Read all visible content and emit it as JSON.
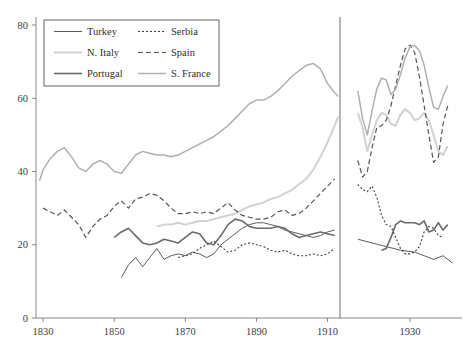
{
  "chart_data": {
    "type": "line",
    "title": "",
    "subtitle": "",
    "xlabel": "",
    "ylabel": "",
    "xlim": [
      1828,
      1941
    ],
    "ylim": [
      0,
      80
    ],
    "grid": false,
    "legend_position": "top-left",
    "x_ticks": [
      1830,
      1850,
      1870,
      1890,
      1910,
      1930
    ],
    "x_tick_labels": [
      "1830",
      "1850",
      "1870",
      "1890",
      "1910",
      "1930"
    ],
    "y_ticks": [
      0,
      20,
      40,
      60,
      80
    ],
    "y_tick_labels": [
      "0",
      "20",
      "40",
      "60",
      "80"
    ],
    "axis_break": {
      "at_x": 1913.5,
      "note": "vertical rule separating pre-WWI and post-WWI panels"
    },
    "series": [
      {
        "name": "Turkey",
        "color": "#4a4a4a",
        "width": 0.9,
        "dash": "none",
        "segments": [
          {
            "panel": "left",
            "x": [
              1852,
              1854,
              1856,
              1858,
              1860,
              1862,
              1864,
              1866,
              1868,
              1870,
              1872,
              1874,
              1876,
              1878,
              1880,
              1882,
              1884,
              1886,
              1888,
              1890,
              1892,
              1894,
              1896,
              1898,
              1900,
              1902,
              1904,
              1906,
              1908,
              1910,
              1912
            ],
            "y": [
              11.0,
              14.5,
              16.5,
              14.0,
              16.5,
              19.0,
              16.0,
              17.0,
              17.5,
              17.0,
              18.0,
              17.5,
              16.5,
              17.5,
              20.0,
              21.5,
              23.0,
              24.5,
              25.5,
              26.0,
              26.0,
              25.5,
              25.0,
              24.0,
              23.5,
              23.0,
              22.5,
              22.0,
              22.5,
              23.5,
              24.0
            ]
          },
          {
            "panel": "right",
            "x": [
              1919,
              1922,
              1925,
              1928,
              1931,
              1933,
              1935,
              1937,
              1939
            ],
            "y": [
              21.5,
              20.5,
              19.5,
              18.5,
              18.0,
              17.0,
              16.0,
              17.0,
              15.0
            ]
          }
        ]
      },
      {
        "name": "N. Italy",
        "color": "#d2d2d2",
        "width": 2.0,
        "dash": "none",
        "segments": [
          {
            "panel": "left",
            "x": [
              1862,
              1864,
              1866,
              1868,
              1870,
              1872,
              1874,
              1876,
              1878,
              1880,
              1882,
              1884,
              1886,
              1888,
              1890,
              1892,
              1894,
              1896,
              1898,
              1900,
              1902,
              1904,
              1906,
              1908,
              1910,
              1912,
              1913
            ],
            "y": [
              25.0,
              25.5,
              25.5,
              26.0,
              25.5,
              26.0,
              26.5,
              26.5,
              27.0,
              27.5,
              28.0,
              28.5,
              29.5,
              30.5,
              31.0,
              31.5,
              32.5,
              33.0,
              34.0,
              35.0,
              36.5,
              38.0,
              40.5,
              44.0,
              48.0,
              52.5,
              55.0
            ]
          },
          {
            "panel": "right",
            "x": [
              1919,
              1920,
              1921,
              1922,
              1923,
              1924,
              1925,
              1926,
              1927,
              1928,
              1929,
              1930,
              1931,
              1932,
              1933,
              1934,
              1935,
              1936,
              1937,
              1938
            ],
            "y": [
              56.0,
              52.0,
              45.5,
              50.0,
              54.0,
              56.0,
              55.5,
              53.0,
              52.5,
              55.5,
              57.0,
              56.0,
              54.0,
              54.5,
              56.0,
              54.0,
              50.0,
              45.5,
              44.5,
              47.0
            ]
          }
        ]
      },
      {
        "name": "Portugal",
        "color": "#6a6a6a",
        "width": 1.6,
        "dash": "none",
        "segments": [
          {
            "panel": "left",
            "x": [
              1850,
              1852,
              1854,
              1856,
              1858,
              1860,
              1862,
              1864,
              1866,
              1868,
              1870,
              1872,
              1874,
              1876,
              1878,
              1880,
              1882,
              1884,
              1886,
              1888,
              1890,
              1892,
              1894,
              1896,
              1898,
              1900,
              1902,
              1904,
              1906,
              1908,
              1910,
              1912
            ],
            "y": [
              22.0,
              23.5,
              24.5,
              22.5,
              20.5,
              20.0,
              20.5,
              21.5,
              21.0,
              20.5,
              22.0,
              23.5,
              23.0,
              20.5,
              20.0,
              22.5,
              25.5,
              27.0,
              26.5,
              25.0,
              24.5,
              24.5,
              24.5,
              25.0,
              24.5,
              23.0,
              22.0,
              22.5,
              23.0,
              23.5,
              23.0,
              22.5
            ]
          },
          {
            "panel": "right",
            "x": [
              1924,
              1925,
              1926,
              1927,
              1928,
              1929,
              1930,
              1931,
              1932,
              1933,
              1934,
              1935,
              1936,
              1937,
              1938
            ],
            "y": [
              18.5,
              19.0,
              22.0,
              25.5,
              26.5,
              26.0,
              26.0,
              26.0,
              25.5,
              26.5,
              23.5,
              24.0,
              26.0,
              24.0,
              25.5
            ]
          }
        ]
      },
      {
        "name": "Serbia",
        "color": "#3f3f3f",
        "width": 1.1,
        "dash": "2,2",
        "segments": [
          {
            "panel": "left",
            "x": [
              1868,
              1870,
              1872,
              1874,
              1876,
              1878,
              1880,
              1882,
              1884,
              1886,
              1888,
              1890,
              1892,
              1894,
              1896,
              1898,
              1900,
              1902,
              1904,
              1906,
              1908,
              1910,
              1912
            ],
            "y": [
              16.5,
              17.0,
              17.5,
              19.0,
              20.0,
              21.0,
              19.5,
              18.0,
              18.5,
              20.0,
              20.5,
              20.0,
              19.5,
              18.5,
              18.0,
              18.5,
              17.5,
              17.0,
              17.0,
              17.5,
              17.0,
              17.5,
              19.0
            ]
          },
          {
            "panel": "right",
            "x": [
              1919,
              1920,
              1921,
              1922,
              1923,
              1924,
              1925,
              1926,
              1927,
              1928,
              1929,
              1930,
              1931,
              1932,
              1933,
              1934,
              1935,
              1936,
              1937
            ],
            "y": [
              36.5,
              35.0,
              34.5,
              36.0,
              33.0,
              28.0,
              25.5,
              25.0,
              22.0,
              19.0,
              17.5,
              17.5,
              18.0,
              19.5,
              23.5,
              25.0,
              24.5,
              22.5,
              22.0
            ]
          }
        ]
      },
      {
        "name": "Spain",
        "color": "#555555",
        "width": 1.2,
        "dash": "5,3",
        "segments": [
          {
            "panel": "left",
            "x": [
              1830,
              1832,
              1834,
              1836,
              1838,
              1840,
              1842,
              1844,
              1846,
              1848,
              1850,
              1852,
              1854,
              1856,
              1858,
              1860,
              1862,
              1864,
              1866,
              1868,
              1870,
              1872,
              1874,
              1876,
              1878,
              1880,
              1882,
              1884,
              1886,
              1888,
              1890,
              1892,
              1894,
              1896,
              1898,
              1900,
              1902,
              1904,
              1906,
              1908,
              1910,
              1912
            ],
            "y": [
              30.0,
              29.0,
              28.0,
              29.5,
              27.5,
              25.5,
              22.0,
              25.0,
              27.0,
              28.0,
              30.5,
              32.0,
              30.0,
              32.5,
              33.0,
              34.0,
              33.5,
              32.0,
              30.0,
              28.5,
              28.5,
              29.0,
              28.5,
              29.0,
              28.5,
              30.0,
              31.5,
              29.5,
              28.0,
              27.5,
              27.0,
              27.0,
              27.5,
              29.0,
              29.5,
              28.0,
              28.5,
              30.0,
              32.0,
              34.0,
              36.0,
              38.0
            ]
          },
          {
            "panel": "right",
            "x": [
              1919,
              1920,
              1921,
              1922,
              1923,
              1924,
              1925,
              1926,
              1927,
              1928,
              1929,
              1930,
              1931,
              1932,
              1933,
              1934,
              1935,
              1936,
              1937,
              1938
            ],
            "y": [
              43.0,
              38.5,
              40.0,
              46.5,
              52.0,
              52.5,
              54.0,
              58.0,
              63.5,
              69.0,
              73.5,
              74.5,
              72.5,
              66.0,
              58.0,
              50.0,
              42.5,
              44.0,
              53.0,
              58.0
            ]
          }
        ]
      },
      {
        "name": "S. France",
        "color": "#b0b0b0",
        "width": 1.5,
        "dash": "none",
        "segments": [
          {
            "panel": "left",
            "x": [
              1829,
              1830,
              1832,
              1834,
              1836,
              1838,
              1840,
              1842,
              1844,
              1846,
              1848,
              1850,
              1852,
              1854,
              1856,
              1858,
              1860,
              1862,
              1864,
              1866,
              1868,
              1870,
              1872,
              1874,
              1876,
              1878,
              1880,
              1882,
              1884,
              1886,
              1888,
              1890,
              1892,
              1894,
              1896,
              1898,
              1900,
              1902,
              1904,
              1906,
              1908,
              1910,
              1912,
              1913
            ],
            "y": [
              37.5,
              40.5,
              43.5,
              45.5,
              46.5,
              44.0,
              41.0,
              40.0,
              42.0,
              43.0,
              42.0,
              40.0,
              39.5,
              42.0,
              44.5,
              45.5,
              45.0,
              44.5,
              44.5,
              44.0,
              44.5,
              45.5,
              46.5,
              47.5,
              48.5,
              49.5,
              51.0,
              52.5,
              54.5,
              56.5,
              58.5,
              59.5,
              59.5,
              60.5,
              62.0,
              64.0,
              66.0,
              67.5,
              69.0,
              69.5,
              68.0,
              64.0,
              61.5,
              60.5
            ]
          },
          {
            "panel": "right",
            "x": [
              1919,
              1920,
              1921,
              1922,
              1923,
              1924,
              1925,
              1926,
              1927,
              1928,
              1929,
              1930,
              1931,
              1932,
              1933,
              1934,
              1935,
              1936,
              1937,
              1938
            ],
            "y": [
              62.0,
              54.5,
              50.0,
              56.5,
              62.5,
              65.5,
              65.0,
              61.0,
              62.5,
              66.5,
              71.0,
              74.0,
              74.5,
              73.0,
              69.0,
              63.0,
              57.5,
              57.0,
              60.5,
              63.5
            ]
          }
        ]
      }
    ]
  },
  "legend": {
    "entries": [
      {
        "label": "Turkey",
        "series": "Turkey",
        "column": 0,
        "row": 0
      },
      {
        "label": "Serbia",
        "series": "Serbia",
        "column": 1,
        "row": 0
      },
      {
        "label": "N. Italy",
        "series": "N. Italy",
        "column": 0,
        "row": 1
      },
      {
        "label": "Spain",
        "series": "Spain",
        "column": 1,
        "row": 1
      },
      {
        "label": "Portugal",
        "series": "Portugal",
        "column": 0,
        "row": 2
      },
      {
        "label": "S. France",
        "series": "S. France",
        "column": 1,
        "row": 2
      }
    ]
  },
  "colors": {
    "axis": "#7c7c7c",
    "text": "#3d3d3d",
    "background": "#ffffff",
    "legend_border": "#555555"
  }
}
